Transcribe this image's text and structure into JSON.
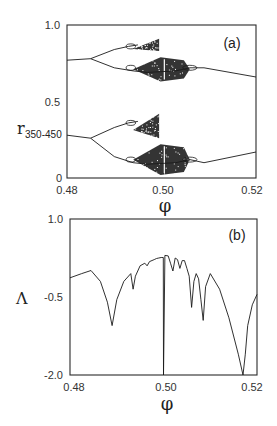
{
  "chart_data": [
    {
      "type": "scatter",
      "panel_label": "(a)",
      "title": "",
      "xlabel": "φ",
      "ylabel": "r",
      "ylabel_subscript": "350-450",
      "xlim": [
        0.48,
        0.52
      ],
      "ylim": [
        0,
        1.0
      ],
      "xticks": [
        "0.48",
        "0.50",
        "0.52"
      ],
      "yticks": [
        "0",
        "0.5",
        "1.0"
      ],
      "grid": false,
      "description": "Bifurcation diagram: r iterates 350-450 vs phi, two symmetric branches with period doubling cascades into chaos near phi=0.50",
      "branches": [
        {
          "name": "upper",
          "main_curve": {
            "x": [
              0.48,
              0.485
            ],
            "y": [
              0.77,
              0.78
            ]
          },
          "split_at": 0.485,
          "upper_arm": {
            "x": [
              0.485,
              0.49,
              0.493,
              0.495
            ],
            "y": [
              0.78,
              0.84,
              0.86,
              0.87
            ]
          },
          "lower_arm": {
            "x": [
              0.485,
              0.49,
              0.494,
              0.497,
              0.503,
              0.506,
              0.509
            ],
            "y": [
              0.78,
              0.72,
              0.7,
              0.69,
              0.7,
              0.72,
              0.72
            ]
          },
          "rejoin_at": 0.509,
          "tail": {
            "x": [
              0.509,
              0.52
            ],
            "y": [
              0.72,
              0.66
            ]
          },
          "chaos_regions": [
            {
              "x": [
                0.494,
                0.4995
              ],
              "y": [
                0.83,
                0.91
              ]
            },
            {
              "x": [
                0.494,
                0.506
              ],
              "y": [
                0.63,
                0.79
              ]
            }
          ]
        },
        {
          "name": "lower",
          "main_curve": {
            "x": [
              0.48,
              0.485
            ],
            "y": [
              0.28,
              0.26
            ]
          },
          "split_at": 0.485,
          "upper_arm": {
            "x": [
              0.485,
              0.49,
              0.493,
              0.495
            ],
            "y": [
              0.26,
              0.33,
              0.36,
              0.37
            ]
          },
          "lower_arm": {
            "x": [
              0.485,
              0.49,
              0.494,
              0.497,
              0.503,
              0.506,
              0.509
            ],
            "y": [
              0.26,
              0.14,
              0.1,
              0.09,
              0.1,
              0.12,
              0.1
            ]
          },
          "rejoin_at": 0.509,
          "tail": {
            "x": [
              0.509,
              0.52
            ],
            "y": [
              0.1,
              0.17
            ]
          },
          "chaos_regions": [
            {
              "x": [
                0.494,
                0.4995
              ],
              "y": [
                0.26,
                0.42
              ]
            },
            {
              "x": [
                0.494,
                0.506
              ],
              "y": [
                0.02,
                0.22
              ]
            }
          ]
        }
      ]
    },
    {
      "type": "line",
      "panel_label": "(b)",
      "title": "",
      "xlabel": "φ",
      "ylabel": "Λ",
      "xlim": [
        0.48,
        0.52
      ],
      "ylim": [
        -2.0,
        1.0
      ],
      "xticks": [
        "0.48",
        "0.50",
        "0.52"
      ],
      "yticks": [
        "-2.0",
        "-0.5",
        "1.0"
      ],
      "grid": false,
      "description": "Lyapunov exponent vs phi with sharp negative spikes at bifurcation points",
      "x": [
        0.48,
        0.4825,
        0.4845,
        0.4865,
        0.488,
        0.489,
        0.49,
        0.4915,
        0.493,
        0.4935,
        0.494,
        0.495,
        0.496,
        0.4965,
        0.497,
        0.498,
        0.4985,
        0.499,
        0.4995,
        0.49995,
        0.5,
        0.5003,
        0.501,
        0.5015,
        0.502,
        0.5025,
        0.503,
        0.5035,
        0.504,
        0.5045,
        0.505,
        0.5055,
        0.506,
        0.5065,
        0.507,
        0.5075,
        0.508,
        0.5085,
        0.509,
        0.51,
        0.512,
        0.514,
        0.516,
        0.517,
        0.5175,
        0.518,
        0.519,
        0.52
      ],
      "y": [
        -0.13,
        -0.05,
        0.01,
        -0.2,
        -0.6,
        -1.05,
        -0.55,
        -0.2,
        -0.05,
        -0.35,
        -0.1,
        0.1,
        0.15,
        0.1,
        0.18,
        0.22,
        0.24,
        0.25,
        0.26,
        0.26,
        -2.0,
        0.3,
        0.29,
        0.15,
        0.0,
        0.25,
        0.22,
        0.05,
        0.2,
        0.2,
        0.05,
        -0.1,
        -0.7,
        -0.2,
        -0.05,
        -0.15,
        -0.55,
        -0.95,
        -0.3,
        -0.05,
        -0.35,
        -0.9,
        -1.6,
        -2.0,
        -1.6,
        -1.05,
        -0.65,
        -0.45
      ]
    }
  ],
  "figure": {
    "panel_a_label": "(a)",
    "panel_b_label": "(b)",
    "a_xlabel": "φ",
    "b_xlabel": "φ",
    "a_ylabel_main": "r",
    "a_ylabel_sub": "350-450",
    "b_ylabel": "Λ",
    "a_yticks": [
      "1.0",
      "0.5",
      "0"
    ],
    "a_xticks": [
      "0.48",
      "0.50",
      "0.52"
    ],
    "b_yticks": [
      "1.0",
      "-0.5",
      "-2.0"
    ],
    "b_xticks": [
      "0.48",
      "0.50",
      "0.52"
    ]
  }
}
